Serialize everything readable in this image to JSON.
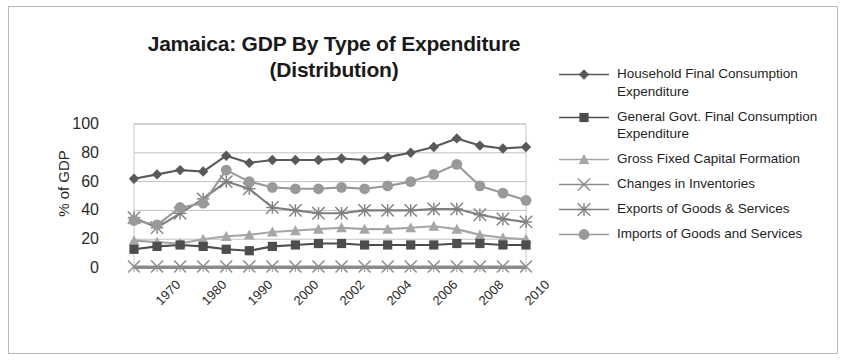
{
  "chart_data": {
    "type": "line",
    "title": "Jamaica: GDP By Type of Expenditure (Distribution)",
    "title_line1": "Jamaica: GDP By Type of Expenditure",
    "title_line2": "(Distribution)",
    "xlabel": "",
    "ylabel": "% of GDP",
    "ylim": [
      0,
      100
    ],
    "yticks": [
      100,
      80,
      60,
      40,
      20,
      0
    ],
    "grid": true,
    "legend_position": "right",
    "x": [
      "1970",
      "1975",
      "1980",
      "1985",
      "1990",
      "1995",
      "2000",
      "2001",
      "2002",
      "2003",
      "2004",
      "2005",
      "2006",
      "2007",
      "2008",
      "2009",
      "2010",
      "2011"
    ],
    "xtick_labels": [
      "1970",
      "1980",
      "1990",
      "2000",
      "2002",
      "2004",
      "2006",
      "2008",
      "2010"
    ],
    "series": [
      {
        "name": "Household Final Consumption Expenditure",
        "marker": "diamond",
        "color": "#595959",
        "values": [
          62,
          65,
          68,
          67,
          78,
          73,
          75,
          75,
          75,
          76,
          75,
          77,
          80,
          84,
          90,
          85,
          83,
          84
        ]
      },
      {
        "name": "General Govt. Final Consumption Expenditure",
        "marker": "square",
        "color": "#4d4d4d",
        "values": [
          13,
          15,
          16,
          15,
          13,
          12,
          15,
          16,
          17,
          17,
          16,
          16,
          16,
          16,
          17,
          17,
          16,
          16
        ]
      },
      {
        "name": "Gross Fixed Capital Formation",
        "marker": "triangle",
        "color": "#a6a6a6",
        "values": [
          19,
          18,
          17,
          20,
          22,
          23,
          25,
          26,
          27,
          28,
          27,
          27,
          28,
          29,
          27,
          23,
          21,
          20
        ]
      },
      {
        "name": "Changes in Inventories",
        "marker": "x",
        "color": "#8c8c8c",
        "values": [
          1,
          1,
          1,
          1,
          1,
          1,
          1,
          1,
          1,
          1,
          1,
          1,
          1,
          1,
          1,
          1,
          1,
          1
        ]
      },
      {
        "name": "Exports of Goods & Services",
        "marker": "star",
        "color": "#7f7f7f",
        "values": [
          35,
          28,
          38,
          48,
          60,
          55,
          42,
          40,
          38,
          38,
          40,
          40,
          40,
          41,
          41,
          37,
          34,
          32
        ]
      },
      {
        "name": "Imports of Goods and Services",
        "marker": "circle",
        "color": "#999999",
        "values": [
          33,
          30,
          42,
          45,
          68,
          60,
          56,
          55,
          55,
          56,
          55,
          57,
          60,
          65,
          72,
          57,
          52,
          47
        ]
      }
    ]
  },
  "legend": {
    "items": [
      {
        "label": "Household Final Consumption Expenditure",
        "marker": "diamond"
      },
      {
        "label": "General Govt. Final Consumption Expenditure",
        "marker": "square"
      },
      {
        "label": "Gross Fixed Capital Formation",
        "marker": "triangle"
      },
      {
        "label": "Changes in Inventories",
        "marker": "x"
      },
      {
        "label": "Exports of Goods & Services",
        "marker": "star"
      },
      {
        "label": "Imports of Goods and Services",
        "marker": "circle"
      }
    ]
  }
}
